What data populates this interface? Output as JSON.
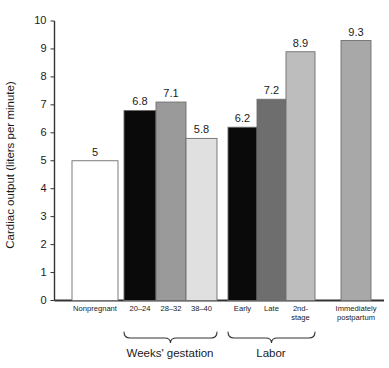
{
  "chart_data": {
    "type": "bar",
    "title": "",
    "xlabel": "",
    "ylabel": "Cardiac output (liters per minute)",
    "ylim": [
      0,
      10
    ],
    "ytick_labels": [
      "0",
      "1",
      "2",
      "3",
      "4",
      "5",
      "6",
      "7",
      "8",
      "9",
      "10"
    ],
    "grid": false,
    "legend": "none",
    "categories": [
      "Nonpregnant",
      "20–24",
      "28–32",
      "38–40",
      "Early",
      "Late",
      "2nd-stage",
      "Immediately postpartum"
    ],
    "values": [
      5,
      6.8,
      7.1,
      5.8,
      6.2,
      7.2,
      8.9,
      9.3
    ],
    "value_labels": [
      "5",
      "6.8",
      "7.1",
      "5.8",
      "6.2",
      "7.2",
      "8.9",
      "9.3"
    ],
    "bar_colors": [
      "#ffffff",
      "#0a0a0a",
      "#9a9a9a",
      "#e0e0e0",
      "#0a0a0a",
      "#6e6e6e",
      "#bdbdbd",
      "#a8a8a8"
    ],
    "group_brackets": [
      {
        "label": "Weeks' gestation",
        "categories": [
          "20–24",
          "28–32",
          "38–40"
        ]
      },
      {
        "label": "Labor",
        "categories": [
          "Early",
          "Late",
          "2nd-stage"
        ]
      }
    ]
  },
  "bars": [
    {
      "name": "nonpregnant",
      "label_line1": "Nonpregnant",
      "label_line2": "",
      "value": 5,
      "value_label": "5",
      "color": "#ffffff"
    },
    {
      "name": "weeks-20-24",
      "label_line1": "20–24",
      "label_line2": "",
      "value": 6.8,
      "value_label": "6.8",
      "color": "#0a0a0a"
    },
    {
      "name": "weeks-28-32",
      "label_line1": "28–32",
      "label_line2": "",
      "value": 7.1,
      "value_label": "7.1",
      "color": "#9a9a9a"
    },
    {
      "name": "weeks-38-40",
      "label_line1": "38–40",
      "label_line2": "",
      "value": 5.8,
      "value_label": "5.8",
      "color": "#e0e0e0"
    },
    {
      "name": "labor-early",
      "label_line1": "Early",
      "label_line2": "",
      "value": 6.2,
      "value_label": "6.2",
      "color": "#0a0a0a"
    },
    {
      "name": "labor-late",
      "label_line1": "Late",
      "label_line2": "",
      "value": 7.2,
      "value_label": "7.2",
      "color": "#6e6e6e"
    },
    {
      "name": "labor-2nd-stage",
      "label_line1": "2nd-",
      "label_line2": "stage",
      "value": 8.9,
      "value_label": "8.9",
      "color": "#bdbdbd"
    },
    {
      "name": "immediately-postpartum",
      "label_line1": "Immediately",
      "label_line2": "postpartum",
      "value": 9.3,
      "value_label": "9.3",
      "color": "#a8a8a8"
    }
  ],
  "axis": {
    "ylabel": "Cardiac output (liters per minute)",
    "ticks": [
      "10",
      "9",
      "8",
      "7",
      "6",
      "5",
      "4",
      "3",
      "2",
      "1",
      "0"
    ]
  },
  "brackets": {
    "gestation_label": "Weeks' gestation",
    "labor_label": "Labor"
  },
  "colors": {
    "axis": "#333333",
    "text": "#1a1a1a",
    "bar_outline": "#6e6e6e",
    "background": "#ffffff"
  }
}
